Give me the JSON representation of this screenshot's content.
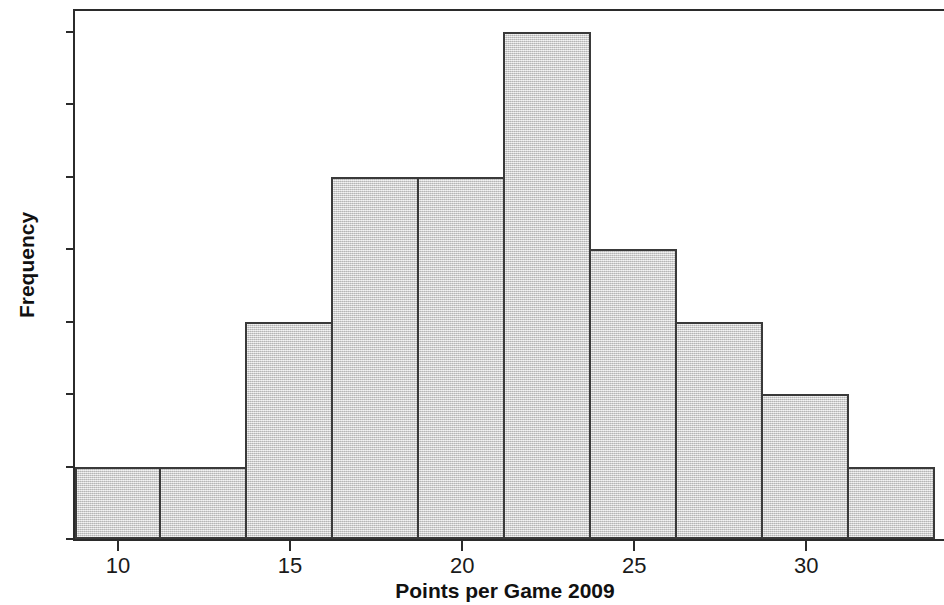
{
  "chart_data": {
    "type": "bar",
    "chart_subtype": "histogram",
    "title": "",
    "xlabel": "Points per Game 2009",
    "ylabel": "Frequency",
    "xlim": [
      8.75,
      34.0
    ],
    "ylim": [
      0,
      7.3
    ],
    "grid": false,
    "legend": null,
    "bin_width": 2.5,
    "bin_edges": [
      8.75,
      11.25,
      13.75,
      16.25,
      18.75,
      21.25,
      23.75,
      26.25,
      28.75,
      31.25,
      33.75
    ],
    "categories": [
      "8.75-11.25",
      "11.25-13.75",
      "13.75-16.25",
      "16.25-18.75",
      "18.75-21.25",
      "21.25-23.75",
      "23.75-26.25",
      "26.25-28.75",
      "28.75-31.25",
      "31.25-33.75"
    ],
    "values": [
      1,
      1,
      3,
      5,
      5,
      7,
      4,
      3,
      2,
      1
    ],
    "total_count": 32,
    "x_ticks": [
      10,
      15,
      20,
      25,
      30
    ],
    "x_tick_labels": [
      "10",
      "15",
      "20",
      "25",
      "30"
    ],
    "y_ticks": [
      0,
      1,
      2,
      3,
      4,
      5,
      6,
      7
    ],
    "y_tick_labels": [
      "0",
      "1",
      "2",
      "3",
      "4",
      "5",
      "6",
      "7"
    ],
    "bar_fill_color": "#d2d2d2",
    "bar_edge_color": "#3a3a3a",
    "axis_color": "#2b2b2b",
    "background_color": "#ffffff"
  }
}
